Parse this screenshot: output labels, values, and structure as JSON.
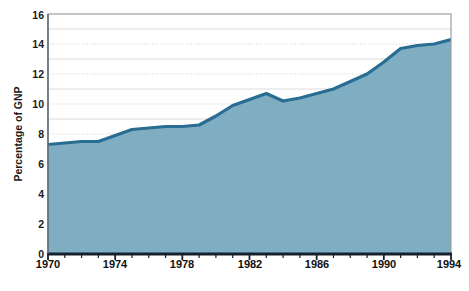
{
  "chart_data": {
    "type": "area",
    "title": "",
    "subtitle": "",
    "xlabel": "",
    "ylabel": "Percentage of GNP",
    "xlim": [
      1970,
      1994
    ],
    "ylim": [
      0,
      16
    ],
    "grid": true,
    "legend": "none",
    "y_ticks": [
      0,
      2,
      4,
      6,
      8,
      10,
      12,
      14,
      16
    ],
    "y_tick_labels": [
      "0",
      "2",
      "4",
      "6",
      "8",
      "10",
      "12",
      "14",
      "16"
    ],
    "x_ticks": [
      1970,
      1974,
      1978,
      1982,
      1986,
      1990,
      1994
    ],
    "x_tick_labels": [
      "1970",
      "1974",
      "1978",
      "1982",
      "1986",
      "1990",
      "1994"
    ],
    "x_minor_tick_interval": 1,
    "x": [
      1970,
      1971,
      1972,
      1973,
      1974,
      1975,
      1976,
      1977,
      1978,
      1979,
      1980,
      1981,
      1982,
      1983,
      1984,
      1985,
      1986,
      1987,
      1988,
      1989,
      1990,
      1991,
      1992,
      1993,
      1994
    ],
    "values": [
      7.3,
      7.4,
      7.5,
      7.5,
      7.9,
      8.3,
      8.4,
      8.5,
      8.5,
      8.6,
      9.2,
      9.9,
      10.3,
      10.7,
      10.2,
      10.4,
      10.7,
      11.0,
      11.5,
      12.0,
      12.8,
      13.7,
      13.9,
      14.0,
      14.3
    ],
    "series": [
      {
        "name": "Percentage of GNP",
        "values": [
          7.3,
          7.4,
          7.5,
          7.5,
          7.9,
          8.3,
          8.4,
          8.5,
          8.5,
          8.6,
          9.2,
          9.9,
          10.3,
          10.7,
          10.2,
          10.4,
          10.7,
          11.0,
          11.5,
          12.0,
          12.8,
          13.7,
          13.9,
          14.0,
          14.3
        ]
      }
    ],
    "colors": {
      "area_fill": "#7FAEC2",
      "line": "#2A6D92",
      "grid": "#c9c9c9",
      "axis": "#1c2b3a",
      "frame": "#9a9a9a",
      "text": "#111111",
      "background": "#ffffff"
    }
  }
}
